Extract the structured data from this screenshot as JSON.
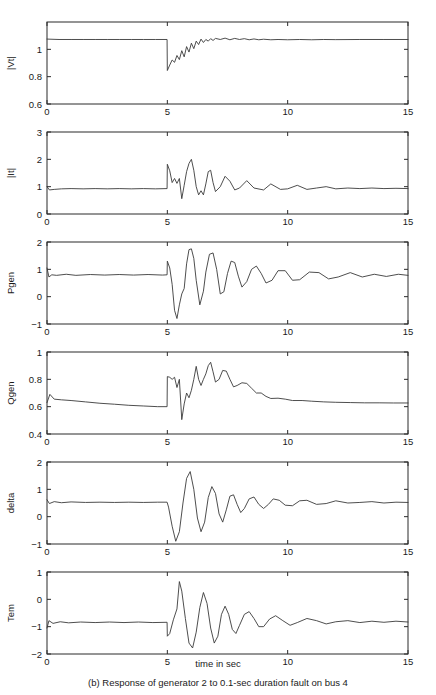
{
  "figure": {
    "caption": "(b) Response of generator 2 to 0.1-sec duration fault on bus 4",
    "xlabel": "time in sec"
  },
  "chart_data": {
    "type": "line",
    "title": "(b) Response of generator 2 to 0.1-sec duration fault on bus 4",
    "xlabel": "time in sec",
    "xlim": [
      0,
      15
    ],
    "xticks": [
      0,
      5,
      10,
      15
    ],
    "xticklabels": [
      "0",
      "5",
      "10",
      "15"
    ],
    "grid": false,
    "legend": "none",
    "event_time_sec": 5,
    "fault_duration_sec": 0.1,
    "panels": [
      {
        "ylabel": "|Vt|",
        "ylim": [
          0.6,
          1.2
        ],
        "yticks": [
          0.6,
          0.8,
          1
        ],
        "yticklabels": [
          "0.6",
          "0.8",
          "1"
        ],
        "x": [
          0,
          0.5,
          1,
          1.5,
          2,
          2.5,
          3,
          3.5,
          4,
          4.5,
          4.99,
          5.0,
          5.1,
          5.2,
          5.3,
          5.4,
          5.5,
          5.6,
          5.7,
          5.8,
          5.9,
          6.0,
          6.1,
          6.2,
          6.3,
          6.4,
          6.5,
          6.6,
          6.7,
          6.8,
          6.9,
          7.0,
          7.2,
          7.4,
          7.6,
          7.8,
          8.0,
          8.2,
          8.4,
          8.6,
          8.8,
          9.0,
          9.3,
          9.6,
          10.0,
          10.5,
          11.0,
          11.5,
          12.0,
          13.0,
          14.0,
          15.0
        ],
        "y": [
          1.075,
          1.072,
          1.072,
          1.072,
          1.072,
          1.072,
          1.072,
          1.072,
          1.072,
          1.072,
          1.072,
          0.845,
          0.885,
          0.922,
          0.905,
          0.955,
          0.925,
          0.99,
          0.945,
          1.02,
          0.98,
          1.045,
          1.005,
          1.06,
          1.035,
          1.075,
          1.05,
          1.072,
          1.06,
          1.078,
          1.065,
          1.08,
          1.072,
          1.082,
          1.07,
          1.08,
          1.072,
          1.078,
          1.07,
          1.076,
          1.07,
          1.074,
          1.07,
          1.072,
          1.07,
          1.072,
          1.07,
          1.072,
          1.071,
          1.072,
          1.072,
          1.072
        ]
      },
      {
        "ylabel": "|It|",
        "ylim": [
          0,
          3
        ],
        "yticks": [
          0,
          1,
          2,
          3
        ],
        "yticklabels": [
          "0",
          "1",
          "2",
          "3"
        ],
        "x": [
          0,
          0.1,
          0.3,
          0.6,
          1.0,
          1.5,
          2.0,
          2.5,
          3.0,
          3.5,
          4.0,
          4.5,
          4.99,
          5.0,
          5.1,
          5.2,
          5.3,
          5.4,
          5.5,
          5.6,
          5.7,
          5.8,
          5.9,
          6.0,
          6.1,
          6.2,
          6.3,
          6.4,
          6.5,
          6.6,
          6.7,
          6.8,
          6.9,
          7.0,
          7.2,
          7.4,
          7.6,
          7.8,
          8.0,
          8.3,
          8.6,
          9.0,
          9.3,
          9.7,
          10.0,
          10.4,
          10.8,
          11.2,
          11.6,
          12.0,
          12.5,
          13.0,
          13.5,
          14.0,
          14.5,
          15.0
        ],
        "y": [
          1.0,
          0.88,
          0.9,
          0.92,
          0.93,
          0.92,
          0.93,
          0.92,
          0.93,
          0.92,
          0.93,
          0.92,
          0.93,
          1.82,
          1.58,
          1.15,
          1.3,
          1.12,
          1.3,
          0.56,
          1.05,
          1.55,
          1.85,
          2.0,
          1.6,
          1.0,
          0.7,
          0.85,
          0.7,
          1.1,
          1.55,
          1.6,
          1.15,
          0.82,
          1.0,
          1.38,
          1.2,
          0.88,
          0.95,
          1.22,
          0.95,
          0.88,
          1.1,
          0.9,
          0.92,
          1.05,
          0.9,
          0.95,
          1.0,
          0.92,
          0.95,
          0.93,
          0.95,
          0.93,
          0.94,
          0.93
        ]
      },
      {
        "ylabel": "Pgen",
        "ylim": [
          -1,
          2
        ],
        "yticks": [
          -1,
          0,
          1,
          2
        ],
        "yticklabels": [
          "−1",
          "0",
          "1",
          "2"
        ],
        "x": [
          0,
          0.08,
          0.2,
          0.4,
          0.8,
          1.2,
          1.8,
          2.4,
          3.0,
          3.6,
          4.2,
          4.8,
          4.99,
          5.0,
          5.1,
          5.2,
          5.3,
          5.4,
          5.5,
          5.6,
          5.7,
          5.8,
          5.9,
          6.0,
          6.1,
          6.2,
          6.35,
          6.5,
          6.6,
          6.75,
          6.9,
          7.05,
          7.2,
          7.35,
          7.5,
          7.65,
          7.8,
          7.95,
          8.1,
          8.3,
          8.5,
          8.7,
          8.9,
          9.1,
          9.35,
          9.6,
          9.9,
          10.2,
          10.5,
          10.9,
          11.3,
          11.7,
          12.1,
          12.6,
          13.1,
          13.6,
          14.1,
          14.6,
          15.0
        ],
        "y": [
          1.05,
          0.72,
          0.8,
          0.78,
          0.82,
          0.78,
          0.81,
          0.79,
          0.81,
          0.79,
          0.81,
          0.79,
          0.8,
          1.3,
          1.05,
          0.45,
          -0.5,
          -0.8,
          -0.3,
          0.1,
          0.3,
          1.2,
          1.72,
          1.75,
          1.4,
          0.6,
          -0.3,
          0.2,
          0.9,
          1.55,
          1.6,
          1.0,
          0.1,
          0.18,
          0.85,
          1.3,
          1.25,
          0.75,
          0.35,
          0.55,
          1.0,
          1.12,
          0.85,
          0.5,
          0.6,
          0.95,
          0.95,
          0.6,
          0.62,
          0.9,
          0.88,
          0.65,
          0.72,
          0.88,
          0.72,
          0.82,
          0.74,
          0.82,
          0.78
        ]
      },
      {
        "ylabel": "Qgen",
        "ylim": [
          0.4,
          1.0
        ],
        "yticks": [
          0.4,
          0.6,
          0.8,
          1
        ],
        "yticklabels": [
          "0.4",
          "0.6",
          "0.8",
          "1"
        ],
        "x": [
          0,
          0.12,
          0.3,
          0.6,
          1.0,
          1.6,
          2.2,
          2.8,
          3.4,
          4.0,
          4.6,
          4.99,
          5.0,
          5.1,
          5.2,
          5.3,
          5.4,
          5.5,
          5.6,
          5.7,
          5.8,
          5.9,
          6.0,
          6.1,
          6.2,
          6.3,
          6.4,
          6.5,
          6.6,
          6.7,
          6.8,
          6.9,
          7.0,
          7.15,
          7.3,
          7.45,
          7.6,
          7.75,
          7.9,
          8.1,
          8.3,
          8.5,
          8.7,
          8.9,
          9.1,
          9.3,
          9.6,
          9.9,
          10.2,
          10.6,
          11.0,
          11.5,
          12.0,
          12.6,
          13.2,
          13.8,
          14.4,
          15.0
        ],
        "y": [
          0.63,
          0.69,
          0.655,
          0.65,
          0.645,
          0.635,
          0.625,
          0.618,
          0.61,
          0.605,
          0.6,
          0.6,
          0.82,
          0.815,
          0.8,
          0.815,
          0.74,
          0.8,
          0.505,
          0.62,
          0.7,
          0.665,
          0.72,
          0.8,
          0.895,
          0.8,
          0.755,
          0.8,
          0.84,
          0.9,
          0.925,
          0.855,
          0.78,
          0.8,
          0.865,
          0.86,
          0.8,
          0.745,
          0.755,
          0.775,
          0.77,
          0.735,
          0.7,
          0.7,
          0.675,
          0.66,
          0.662,
          0.655,
          0.645,
          0.645,
          0.64,
          0.635,
          0.632,
          0.63,
          0.628,
          0.628,
          0.627,
          0.627
        ]
      },
      {
        "ylabel": "delta",
        "ylim": [
          -1,
          2
        ],
        "yticks": [
          -1,
          0,
          1,
          2
        ],
        "yticklabels": [
          "−1",
          "0",
          "1",
          "2"
        ],
        "x": [
          0,
          0.1,
          0.3,
          0.6,
          1.0,
          1.6,
          2.2,
          2.8,
          3.4,
          4.0,
          4.6,
          4.99,
          5.05,
          5.2,
          5.35,
          5.5,
          5.65,
          5.8,
          5.95,
          6.1,
          6.25,
          6.4,
          6.55,
          6.7,
          6.85,
          7.0,
          7.15,
          7.3,
          7.45,
          7.6,
          7.75,
          7.9,
          8.05,
          8.2,
          8.4,
          8.6,
          8.8,
          9.0,
          9.2,
          9.4,
          9.65,
          9.9,
          10.2,
          10.5,
          10.8,
          11.2,
          11.6,
          12.0,
          12.5,
          13.0,
          13.5,
          14.0,
          14.5,
          15.0
        ],
        "y": [
          0.62,
          0.48,
          0.55,
          0.51,
          0.54,
          0.52,
          0.53,
          0.52,
          0.53,
          0.52,
          0.53,
          0.53,
          0.35,
          -0.35,
          -0.9,
          -0.55,
          0.5,
          1.4,
          1.65,
          1.0,
          -0.05,
          -0.55,
          -0.2,
          0.7,
          1.1,
          0.85,
          0.1,
          -0.2,
          0.25,
          0.75,
          0.8,
          0.45,
          0.15,
          0.3,
          0.65,
          0.72,
          0.45,
          0.3,
          0.45,
          0.65,
          0.6,
          0.42,
          0.4,
          0.58,
          0.6,
          0.45,
          0.48,
          0.58,
          0.5,
          0.52,
          0.55,
          0.5,
          0.53,
          0.52
        ]
      },
      {
        "ylabel": "Tem",
        "ylim": [
          -2,
          1
        ],
        "yticks": [
          -2,
          -1,
          0,
          1
        ],
        "yticklabels": [
          "−2",
          "−1",
          "0",
          "1"
        ],
        "x": [
          0,
          0.08,
          0.25,
          0.55,
          0.9,
          1.4,
          2.0,
          2.6,
          3.2,
          3.8,
          4.4,
          4.99,
          5.0,
          5.1,
          5.25,
          5.4,
          5.5,
          5.6,
          5.75,
          5.9,
          6.05,
          6.2,
          6.35,
          6.5,
          6.65,
          6.8,
          6.95,
          7.1,
          7.25,
          7.4,
          7.55,
          7.7,
          7.85,
          8.0,
          8.2,
          8.4,
          8.6,
          8.8,
          9.0,
          9.25,
          9.5,
          9.8,
          10.1,
          10.4,
          10.8,
          11.2,
          11.6,
          12.0,
          12.5,
          13.0,
          13.5,
          14.0,
          14.5,
          15.0
        ],
        "y": [
          -1.05,
          -0.78,
          -0.88,
          -0.82,
          -0.86,
          -0.83,
          -0.85,
          -0.83,
          -0.85,
          -0.83,
          -0.85,
          -0.84,
          -1.35,
          -1.25,
          -0.75,
          -0.35,
          0.65,
          0.3,
          -0.7,
          -1.6,
          -1.78,
          -1.2,
          -0.3,
          0.25,
          -0.15,
          -1.05,
          -1.6,
          -1.35,
          -0.55,
          -0.25,
          -0.55,
          -1.1,
          -1.25,
          -0.95,
          -0.55,
          -0.45,
          -0.7,
          -1.0,
          -1.0,
          -0.72,
          -0.6,
          -0.78,
          -0.95,
          -0.85,
          -0.7,
          -0.78,
          -0.9,
          -0.82,
          -0.78,
          -0.85,
          -0.8,
          -0.84,
          -0.8,
          -0.83
        ]
      }
    ]
  }
}
